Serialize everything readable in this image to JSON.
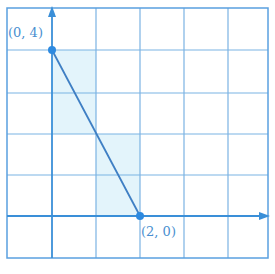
{
  "diagram": {
    "type": "coordinate-grid",
    "grid": {
      "columns": 6,
      "rows": 6,
      "line_color": "#7bb3e3",
      "axis_color": "#3a8fd8"
    },
    "shading_color": "#e3f4fb",
    "line_segment": {
      "from": [
        0,
        4
      ],
      "to": [
        2,
        0
      ],
      "color": "#3f7fc4"
    },
    "points": [
      {
        "label": "(0, 4)",
        "x": 0,
        "y": 4
      },
      {
        "label": "(2, 0)",
        "x": 2,
        "y": 0
      }
    ]
  }
}
